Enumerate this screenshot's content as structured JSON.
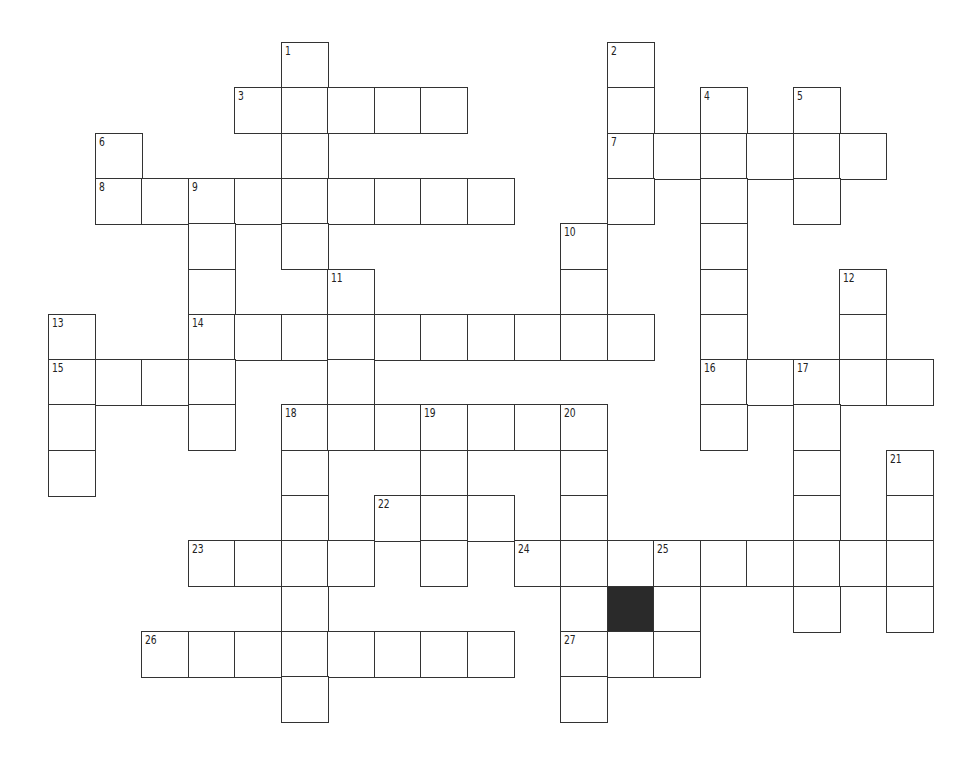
{
  "puzzle": {
    "title": "",
    "grid": {
      "origin_x": 48,
      "origin_y": 42,
      "cell_w": 46.55,
      "cell_h": 45.3,
      "cols": 19,
      "rows": 15
    },
    "colors": {
      "line": "#333333",
      "block": "#2a2a2a",
      "background": "#ffffff"
    },
    "cells": [
      {
        "r": 0,
        "c": 5,
        "n": "1"
      },
      {
        "r": 0,
        "c": 12,
        "n": "2"
      },
      {
        "r": 1,
        "c": 4,
        "n": "3"
      },
      {
        "r": 1,
        "c": 5
      },
      {
        "r": 1,
        "c": 6
      },
      {
        "r": 1,
        "c": 7
      },
      {
        "r": 1,
        "c": 8
      },
      {
        "r": 1,
        "c": 12
      },
      {
        "r": 1,
        "c": 14,
        "n": "4"
      },
      {
        "r": 1,
        "c": 16,
        "n": "5"
      },
      {
        "r": 2,
        "c": 1,
        "n": "6"
      },
      {
        "r": 2,
        "c": 5
      },
      {
        "r": 2,
        "c": 12,
        "n": "7"
      },
      {
        "r": 2,
        "c": 13
      },
      {
        "r": 2,
        "c": 14
      },
      {
        "r": 2,
        "c": 15
      },
      {
        "r": 2,
        "c": 16
      },
      {
        "r": 2,
        "c": 17
      },
      {
        "r": 3,
        "c": 1,
        "n": "8"
      },
      {
        "r": 3,
        "c": 2
      },
      {
        "r": 3,
        "c": 3,
        "n": "9"
      },
      {
        "r": 3,
        "c": 4
      },
      {
        "r": 3,
        "c": 5
      },
      {
        "r": 3,
        "c": 6
      },
      {
        "r": 3,
        "c": 7
      },
      {
        "r": 3,
        "c": 8
      },
      {
        "r": 3,
        "c": 9
      },
      {
        "r": 3,
        "c": 12
      },
      {
        "r": 3,
        "c": 14
      },
      {
        "r": 3,
        "c": 16
      },
      {
        "r": 4,
        "c": 3
      },
      {
        "r": 4,
        "c": 5
      },
      {
        "r": 4,
        "c": 11,
        "n": "10"
      },
      {
        "r": 4,
        "c": 14
      },
      {
        "r": 5,
        "c": 3
      },
      {
        "r": 5,
        "c": 6,
        "n": "11"
      },
      {
        "r": 5,
        "c": 11
      },
      {
        "r": 5,
        "c": 14
      },
      {
        "r": 5,
        "c": 17,
        "n": "12"
      },
      {
        "r": 6,
        "c": 0,
        "n": "13"
      },
      {
        "r": 6,
        "c": 3,
        "n": "14"
      },
      {
        "r": 6,
        "c": 4
      },
      {
        "r": 6,
        "c": 5
      },
      {
        "r": 6,
        "c": 6
      },
      {
        "r": 6,
        "c": 7
      },
      {
        "r": 6,
        "c": 8
      },
      {
        "r": 6,
        "c": 9
      },
      {
        "r": 6,
        "c": 10
      },
      {
        "r": 6,
        "c": 11
      },
      {
        "r": 6,
        "c": 12
      },
      {
        "r": 6,
        "c": 14
      },
      {
        "r": 6,
        "c": 17
      },
      {
        "r": 7,
        "c": 0,
        "n": "15"
      },
      {
        "r": 7,
        "c": 1
      },
      {
        "r": 7,
        "c": 2
      },
      {
        "r": 7,
        "c": 3
      },
      {
        "r": 7,
        "c": 6
      },
      {
        "r": 7,
        "c": 14,
        "n": "16"
      },
      {
        "r": 7,
        "c": 15
      },
      {
        "r": 7,
        "c": 16,
        "n": "17"
      },
      {
        "r": 7,
        "c": 17
      },
      {
        "r": 7,
        "c": 18
      },
      {
        "r": 8,
        "c": 0
      },
      {
        "r": 8,
        "c": 3
      },
      {
        "r": 8,
        "c": 5,
        "n": "18"
      },
      {
        "r": 8,
        "c": 6
      },
      {
        "r": 8,
        "c": 7
      },
      {
        "r": 8,
        "c": 8,
        "n": "19"
      },
      {
        "r": 8,
        "c": 9
      },
      {
        "r": 8,
        "c": 10
      },
      {
        "r": 8,
        "c": 11,
        "n": "20"
      },
      {
        "r": 8,
        "c": 14
      },
      {
        "r": 8,
        "c": 16
      },
      {
        "r": 9,
        "c": 0
      },
      {
        "r": 9,
        "c": 5
      },
      {
        "r": 9,
        "c": 8
      },
      {
        "r": 9,
        "c": 11
      },
      {
        "r": 9,
        "c": 16
      },
      {
        "r": 9,
        "c": 18,
        "n": "21"
      },
      {
        "r": 10,
        "c": 5
      },
      {
        "r": 10,
        "c": 7,
        "n": "22"
      },
      {
        "r": 10,
        "c": 8
      },
      {
        "r": 10,
        "c": 9
      },
      {
        "r": 10,
        "c": 11
      },
      {
        "r": 10,
        "c": 16
      },
      {
        "r": 10,
        "c": 18
      },
      {
        "r": 11,
        "c": 3,
        "n": "23"
      },
      {
        "r": 11,
        "c": 4
      },
      {
        "r": 11,
        "c": 5
      },
      {
        "r": 11,
        "c": 6
      },
      {
        "r": 11,
        "c": 8
      },
      {
        "r": 11,
        "c": 10,
        "n": "24"
      },
      {
        "r": 11,
        "c": 11
      },
      {
        "r": 11,
        "c": 12
      },
      {
        "r": 11,
        "c": 13,
        "n": "25"
      },
      {
        "r": 11,
        "c": 14
      },
      {
        "r": 11,
        "c": 15
      },
      {
        "r": 11,
        "c": 16
      },
      {
        "r": 11,
        "c": 17
      },
      {
        "r": 11,
        "c": 18
      },
      {
        "r": 12,
        "c": 5
      },
      {
        "r": 12,
        "c": 11
      },
      {
        "r": 12,
        "c": 12,
        "black": true
      },
      {
        "r": 12,
        "c": 13
      },
      {
        "r": 12,
        "c": 16
      },
      {
        "r": 12,
        "c": 18
      },
      {
        "r": 13,
        "c": 2,
        "n": "26"
      },
      {
        "r": 13,
        "c": 3
      },
      {
        "r": 13,
        "c": 4
      },
      {
        "r": 13,
        "c": 5
      },
      {
        "r": 13,
        "c": 6
      },
      {
        "r": 13,
        "c": 7
      },
      {
        "r": 13,
        "c": 8
      },
      {
        "r": 13,
        "c": 9
      },
      {
        "r": 13,
        "c": 11,
        "n": "27"
      },
      {
        "r": 13,
        "c": 12
      },
      {
        "r": 13,
        "c": 13
      },
      {
        "r": 14,
        "c": 5
      },
      {
        "r": 14,
        "c": 11
      }
    ],
    "clue_numbers": [
      "1",
      "2",
      "3",
      "4",
      "5",
      "6",
      "7",
      "8",
      "9",
      "10",
      "11",
      "12",
      "13",
      "14",
      "15",
      "16",
      "17",
      "18",
      "19",
      "20",
      "21",
      "22",
      "23",
      "24",
      "25",
      "26",
      "27"
    ]
  }
}
